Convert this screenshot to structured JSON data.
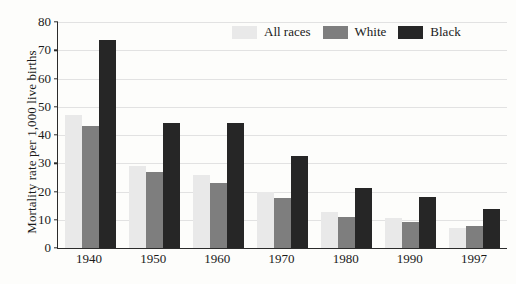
{
  "chart_data": {
    "type": "bar",
    "title": "",
    "subtitle": "",
    "xlabel": "",
    "ylabel": "Mortality rate per 1,000 live births",
    "categories": [
      "1940",
      "1950",
      "1960",
      "1970",
      "1980",
      "1990",
      "1997"
    ],
    "series": [
      {
        "name": "All races",
        "color": "#e9e9e9",
        "values": [
          47.0,
          29.2,
          26.0,
          20.0,
          12.6,
          10.6,
          7.2
        ]
      },
      {
        "name": "White",
        "color": "#7e7e7e",
        "values": [
          43.2,
          26.8,
          22.9,
          17.8,
          11.0,
          9.2,
          7.8
        ]
      },
      {
        "name": "Black",
        "color": "#262626",
        "values": [
          73.8,
          44.3,
          44.3,
          32.6,
          21.4,
          18.0,
          13.7
        ]
      }
    ],
    "ylim": [
      0,
      80
    ],
    "ytick_step": 10,
    "yticks": [
      "0",
      "10",
      "20",
      "30",
      "40",
      "50",
      "60",
      "70",
      "80"
    ],
    "grid": true,
    "legend_position": "top-right-inside",
    "background_color": "#fdfdfb",
    "axis_color": "#2b2b2b",
    "gridline_color": "#e2e2e2"
  }
}
